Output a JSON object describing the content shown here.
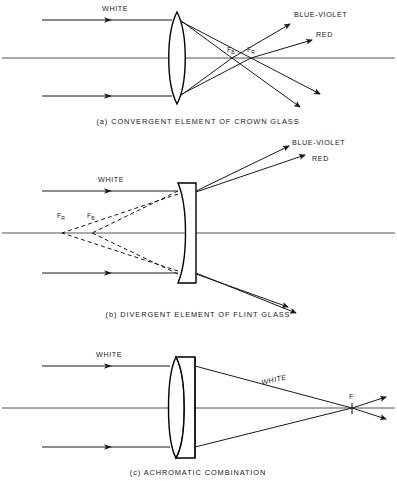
{
  "figure": {
    "panels": [
      {
        "id": "a",
        "caption": "(a) CONVERGENT ELEMENT OF CROWN GLASS",
        "lens_type": "biconvex",
        "incoming_label": "WHITE",
        "ray_labels": [
          "BLUE-VIOLET",
          "RED"
        ],
        "focal_points": [
          {
            "symbol": "F",
            "subscript": "B",
            "meaning": "blue focus"
          },
          {
            "symbol": "F",
            "subscript": "R",
            "meaning": "red focus"
          }
        ]
      },
      {
        "id": "b",
        "caption": "(b) DIVERGENT ELEMENT OF FLINT GLASS",
        "lens_type": "plano-concave",
        "incoming_label": "WHITE",
        "ray_labels": [
          "BLUE-VIOLET",
          "RED"
        ],
        "focal_points": [
          {
            "symbol": "F",
            "subscript": "R",
            "meaning": "virtual red focus"
          },
          {
            "symbol": "F",
            "subscript": "B",
            "meaning": "virtual blue focus"
          }
        ]
      },
      {
        "id": "c",
        "caption": "(c) ACHROMATIC COMBINATION",
        "lens_type": "cemented-doublet",
        "incoming_label": "WHITE",
        "ray_labels": [
          "WHITE"
        ],
        "focal_points": [
          {
            "symbol": "F",
            "subscript": "",
            "meaning": "common focus"
          }
        ]
      }
    ],
    "colors": {
      "ink": "#1a1a1a",
      "axis": "#555555",
      "background": "#ffffff"
    }
  }
}
